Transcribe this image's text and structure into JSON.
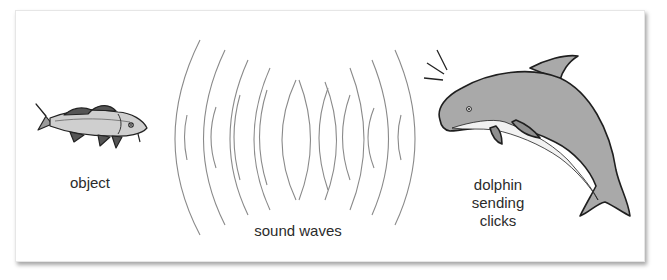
{
  "diagram": {
    "labels": {
      "object": "object",
      "sound_waves": "sound waves",
      "dolphin_line1": "dolphin",
      "dolphin_line2": "sending",
      "dolphin_line3": "clicks"
    },
    "icons": {
      "object": "fish-icon",
      "source": "dolphin-icon",
      "signal": "sound-waves-icon",
      "clicks": "click-lines-icon"
    },
    "colors": {
      "background": "#ffffff",
      "wave_stroke": "#8a8a8a",
      "dolphin_body": "#a9a9a9",
      "dolphin_belly": "#f2f2f2",
      "fish_body": "#c9c9c9",
      "text": "#2b2b2b"
    }
  }
}
